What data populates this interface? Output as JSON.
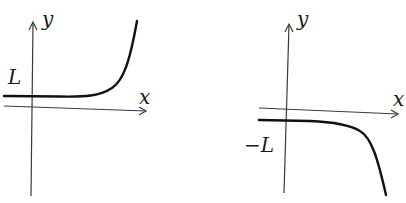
{
  "figure": {
    "panels": [
      {
        "id": "left",
        "x_label": "x",
        "y_label": "y",
        "asymptote_label": "L",
        "description": "Curve approaching horizontal asymptote y = L from the left, increasing rapidly to the right"
      },
      {
        "id": "right",
        "x_label": "x",
        "y_label": "y",
        "asymptote_label": "−L",
        "description": "Curve approaching horizontal asymptote y = −L from the left, decreasing rapidly to the right"
      }
    ]
  },
  "colors": {
    "background": "#ffffff",
    "ink": "#111111"
  }
}
